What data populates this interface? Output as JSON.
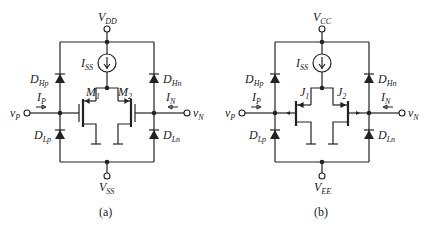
{
  "figure": {
    "panels": [
      {
        "id": "a",
        "caption": "(a)",
        "supply_top": {
          "main": "V",
          "sub": "DD"
        },
        "supply_bottom": {
          "main": "V",
          "sub": "SS"
        },
        "current_source": {
          "main": "I",
          "sub": "SS"
        },
        "device_type": "MOSFET",
        "device_left": {
          "main": "M",
          "sub": "1"
        },
        "device_right": {
          "main": "M",
          "sub": "2"
        },
        "diode_hp": {
          "main": "D",
          "sub": "Hp"
        },
        "diode_hn": {
          "main": "D",
          "sub": "Hn"
        },
        "diode_lp": {
          "main": "D",
          "sub": "Lp"
        },
        "diode_ln": {
          "main": "D",
          "sub": "Ln"
        },
        "input_p": {
          "main": "v",
          "sub": "P"
        },
        "input_n": {
          "main": "v",
          "sub": "N"
        },
        "current_p": {
          "main": "I",
          "sub": "P"
        },
        "current_n": {
          "main": "I",
          "sub": "N"
        }
      },
      {
        "id": "b",
        "caption": "(b)",
        "supply_top": {
          "main": "V",
          "sub": "CC"
        },
        "supply_bottom": {
          "main": "V",
          "sub": "EE"
        },
        "current_source": {
          "main": "I",
          "sub": "SS"
        },
        "device_type": "JFET",
        "device_left": {
          "main": "J",
          "sub": "1"
        },
        "device_right": {
          "main": "J",
          "sub": "2"
        },
        "diode_hp": {
          "main": "D",
          "sub": "Hp"
        },
        "diode_hn": {
          "main": "D",
          "sub": "Hn"
        },
        "diode_lp": {
          "main": "D",
          "sub": "Lp"
        },
        "diode_ln": {
          "main": "D",
          "sub": "Ln"
        },
        "input_p": {
          "main": "v",
          "sub": "P"
        },
        "input_n": {
          "main": "v",
          "sub": "N"
        },
        "current_p": {
          "main": "I",
          "sub": "P"
        },
        "current_n": {
          "main": "I",
          "sub": "N"
        }
      }
    ]
  }
}
